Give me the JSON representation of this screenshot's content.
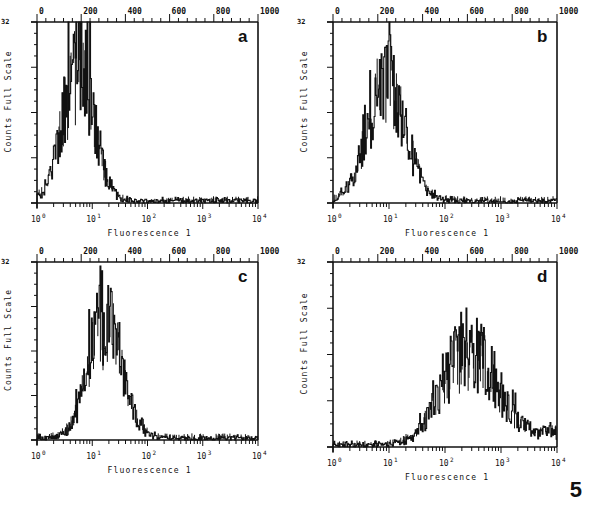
{
  "figure_number": "5",
  "chart_data": [
    {
      "panel": "a",
      "type": "histogram",
      "title": "",
      "xlabel": "Fluorescence 1",
      "ylabel": "Counts Full Scale",
      "y_fullscale_label": "32",
      "x_scale": "log",
      "x_ticks": [
        "10^0",
        "10^1",
        "10^2",
        "10^3",
        "10^4"
      ],
      "top_axis_ticks": [
        "0",
        "200",
        "400",
        "600",
        "800",
        "1000"
      ],
      "xlim": [
        1,
        10000
      ],
      "ylim": [
        0,
        32
      ],
      "peak_x": 5.5,
      "peak_y": 26,
      "spread_decades": 0.28,
      "x": [
        1.0,
        1.5,
        2.0,
        2.5,
        3.0,
        4.0,
        5.0,
        5.5,
        6.0,
        7.0,
        8.0,
        10.0,
        13.0,
        17.0,
        25.0,
        40.0
      ],
      "values": [
        2,
        2,
        3,
        5,
        9,
        16,
        22,
        26,
        22,
        16,
        12,
        7,
        4,
        2,
        1,
        0
      ]
    },
    {
      "panel": "b",
      "type": "histogram",
      "xlabel": "Fluorescence 1",
      "ylabel": "Counts Full Scale",
      "y_fullscale_label": "32",
      "x_scale": "log",
      "x_ticks": [
        "10^0",
        "10^1",
        "10^2",
        "10^3",
        "10^4"
      ],
      "top_axis_ticks": [
        "0",
        "200",
        "400",
        "600",
        "800",
        "1000"
      ],
      "xlim": [
        1,
        10000
      ],
      "ylim": [
        0,
        32
      ],
      "peak_x": 9,
      "peak_y": 24,
      "spread_decades": 0.33,
      "x": [
        1.0,
        2.0,
        3.0,
        4.0,
        5.0,
        6.0,
        7.0,
        8.0,
        9.0,
        10.0,
        12.0,
        15.0,
        20.0,
        30.0,
        50.0,
        100.0
      ],
      "values": [
        1,
        2,
        4,
        8,
        12,
        16,
        19,
        22,
        24,
        21,
        18,
        13,
        8,
        4,
        2,
        1
      ]
    },
    {
      "panel": "c",
      "type": "histogram",
      "xlabel": "Fluorescence 1",
      "ylabel": "Counts Full Scale",
      "y_fullscale_label": "32",
      "x_scale": "log",
      "x_ticks": [
        "10^0",
        "10^1",
        "10^2",
        "10^3",
        "10^4"
      ],
      "top_axis_ticks": [
        "0",
        "200",
        "400",
        "600",
        "800",
        "1000"
      ],
      "xlim": [
        1,
        10000
      ],
      "ylim": [
        0,
        32
      ],
      "peak_x": 17,
      "peak_y": 23,
      "spread_decades": 0.3,
      "x": [
        1.0,
        2.0,
        3.0,
        4.0,
        5.0,
        7.0,
        10.0,
        13.0,
        17.0,
        20.0,
        25.0,
        35.0,
        50.0,
        70.0,
        100.0,
        150.0
      ],
      "values": [
        1,
        1,
        2,
        4,
        9,
        14,
        18,
        20,
        23,
        20,
        15,
        10,
        5,
        2,
        1,
        1
      ]
    },
    {
      "panel": "d",
      "type": "histogram",
      "xlabel": "Fluorescence 1",
      "ylabel": "Counts Full Scale",
      "y_fullscale_label": "32",
      "x_scale": "log",
      "x_ticks": [
        "10^0",
        "10^1",
        "10^2",
        "10^3",
        "10^4"
      ],
      "top_axis_ticks": [
        "0",
        "200",
        "400",
        "600",
        "800",
        "1000"
      ],
      "xlim": [
        1,
        10000
      ],
      "ylim": [
        0,
        32
      ],
      "peak_x": 250,
      "peak_y": 18,
      "spread_decades": 0.45,
      "x": [
        1,
        3,
        10,
        20,
        40,
        60,
        100,
        150,
        200,
        250,
        350,
        500,
        800,
        1500,
        3000,
        8000
      ],
      "values": [
        1,
        1,
        1,
        2,
        5,
        8,
        11,
        13,
        16,
        18,
        14,
        9,
        5,
        3,
        3,
        2
      ]
    }
  ],
  "panels": [
    {
      "label": "a",
      "xlabel": "Fluorescence 1",
      "ylabel": "Counts Full Scale",
      "yscale_label": "32"
    },
    {
      "label": "b",
      "xlabel": "Fluorescence 1",
      "ylabel": "Counts Full Scale",
      "yscale_label": "32"
    },
    {
      "label": "c",
      "xlabel": "Fluorescence 1",
      "ylabel": "Counts Full Scale",
      "yscale_label": "32"
    },
    {
      "label": "d",
      "xlabel": "Fluorescence 1",
      "ylabel": "Counts Full Scale",
      "yscale_label": "32"
    }
  ],
  "axis": {
    "bottom_ticks": [
      "10",
      "10",
      "10",
      "10",
      "10"
    ],
    "bottom_exps": [
      "0",
      "1",
      "2",
      "3",
      "4"
    ],
    "top_ticks": [
      "0",
      "200",
      "400",
      "600",
      "800",
      "1000"
    ]
  }
}
